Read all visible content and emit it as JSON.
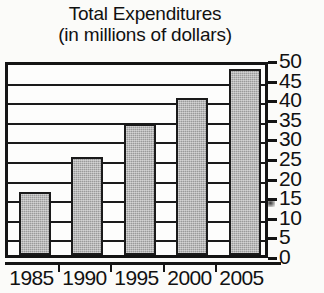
{
  "chart_data": {
    "type": "bar",
    "title": "Total Expenditures (in millions of dollars)",
    "title_lines": [
      "Total Expenditures",
      "(in millions of dollars)"
    ],
    "xlabel": "",
    "ylabel": "",
    "categories": [
      "1985",
      "1990",
      "1995",
      "2000",
      "2005"
    ],
    "values": [
      16,
      25,
      33.5,
      40,
      47.5
    ],
    "ylim": [
      0,
      50
    ],
    "ytick_step": 5,
    "yticks": [
      "50",
      "45",
      "40",
      "35",
      "30",
      "25",
      "20",
      "15",
      "10",
      "5",
      "0"
    ],
    "ytick_values": [
      50,
      45,
      40,
      35,
      30,
      25,
      20,
      15,
      10,
      5,
      0
    ],
    "y_axis_position": "right",
    "grid": true,
    "grid_orientation": "horizontal",
    "legend": false,
    "bar_fill_color": "#9a9a9a",
    "bar_edge_color": "#1a1a1a",
    "frame_color": "#141414",
    "background_color": "#fbfbf9"
  }
}
